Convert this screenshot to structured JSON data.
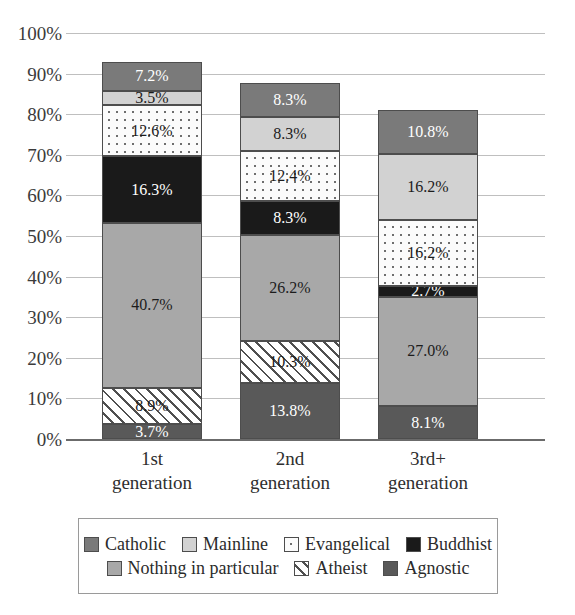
{
  "chart_data": {
    "type": "bar",
    "subtype": "stacked-100-percent",
    "title": "",
    "xlabel": "",
    "ylabel": "",
    "ylim": [
      0,
      100
    ],
    "ytick_labels": [
      "100%",
      "90%",
      "80%",
      "70%",
      "60%",
      "50%",
      "40%",
      "30%",
      "20%",
      "10%",
      "0%"
    ],
    "ytick_values": [
      100,
      90,
      80,
      70,
      60,
      50,
      40,
      30,
      20,
      10,
      0
    ],
    "grid": true,
    "legend_position": "bottom",
    "categories": [
      "1st generation",
      "2nd generation",
      "3rd+ generation"
    ],
    "category_lines": [
      [
        "1st",
        "generation"
      ],
      [
        "2nd",
        "generation"
      ],
      [
        "3rd+",
        "generation"
      ]
    ],
    "series": [
      {
        "name": "Agnostic",
        "color": "#595959",
        "pattern": "solid",
        "values": [
          3.7,
          13.8,
          8.1
        ],
        "labels": [
          "3.7%",
          "13.8%",
          "8.1%"
        ],
        "label_color": "light"
      },
      {
        "name": "Atheist",
        "color": "#ffffff",
        "pattern": "diagonal",
        "values": [
          8.9,
          10.3,
          0
        ],
        "labels": [
          "8.9%",
          "10.3%",
          ""
        ],
        "label_color": "dark"
      },
      {
        "name": "Nothing in particular",
        "color": "#a8a8a8",
        "pattern": "solid",
        "values": [
          40.7,
          26.2,
          27.0
        ],
        "labels": [
          "40.7%",
          "26.2%",
          "27.0%"
        ],
        "label_color": "dark"
      },
      {
        "name": "Buddhist",
        "color": "#1a1a1a",
        "pattern": "solid",
        "values": [
          16.3,
          8.3,
          2.7
        ],
        "labels": [
          "16.3%",
          "8.3%",
          "2.7%"
        ],
        "label_color": "light"
      },
      {
        "name": "Evangelical",
        "color": "#fbfbfb",
        "pattern": "dotted",
        "values": [
          12.6,
          12.4,
          16.2
        ],
        "labels": [
          "12.6%",
          "12.4%",
          "16.2%"
        ],
        "label_color": "dark"
      },
      {
        "name": "Mainline",
        "color": "#d2d2d2",
        "pattern": "solid",
        "values": [
          3.5,
          8.3,
          16.2
        ],
        "labels": [
          "3.5%",
          "8.3%",
          "16.2%"
        ],
        "label_color": "dark"
      },
      {
        "name": "Catholic",
        "color": "#7a7a7a",
        "pattern": "solid",
        "values": [
          7.2,
          8.3,
          10.8
        ],
        "labels": [
          "7.2%",
          "8.3%",
          "10.8%"
        ],
        "label_color": "light"
      }
    ],
    "bar_totals": [
      92.9,
      87.6,
      81.0
    ]
  },
  "legend": {
    "rows": [
      [
        {
          "label": "Catholic",
          "series": "Catholic"
        },
        {
          "label": "Mainline",
          "series": "Mainline"
        },
        {
          "label": "Evangelical",
          "series": "Evangelical"
        },
        {
          "label": "Buddhist",
          "series": "Buddhist"
        }
      ],
      [
        {
          "label": "Nothing in particular",
          "series": "Nothing in particular"
        },
        {
          "label": "Atheist",
          "series": "Atheist"
        },
        {
          "label": "Agnostic",
          "series": "Agnostic"
        }
      ]
    ]
  }
}
